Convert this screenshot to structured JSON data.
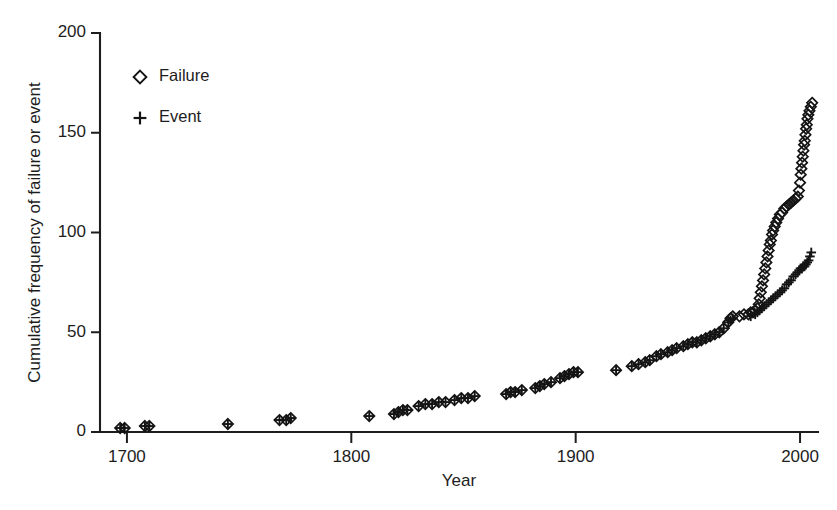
{
  "figure": {
    "background_color": "#ffffff",
    "ink_color": "#141414"
  },
  "chart_data": {
    "type": "scatter",
    "title": "",
    "xlabel": "Year",
    "ylabel": "Cumulative frequency of failure or event",
    "xlim": [
      1688,
      2008
    ],
    "ylim": [
      0,
      200
    ],
    "xticks": [
      1700,
      1800,
      1900,
      2000
    ],
    "xtick_labels": [
      "1700",
      "1800",
      "1900",
      "2000"
    ],
    "yticks": [
      0,
      50,
      100,
      150,
      200
    ],
    "ytick_labels": [
      "0",
      "50",
      "100",
      "150",
      "200"
    ],
    "grid": false,
    "legend_position": "upper-left-inside",
    "legend": [
      {
        "name": "Failure",
        "marker": "diamond"
      },
      {
        "name": "Event",
        "marker": "plus"
      }
    ],
    "series": [
      {
        "name": "Failure",
        "marker": "diamond",
        "color": "#141414",
        "points": [
          [
            1697,
            2
          ],
          [
            1699,
            2
          ],
          [
            1708,
            3
          ],
          [
            1710,
            3
          ],
          [
            1745,
            4
          ],
          [
            1768,
            6
          ],
          [
            1771,
            6
          ],
          [
            1773,
            7
          ],
          [
            1808,
            8
          ],
          [
            1819,
            9
          ],
          [
            1821,
            10
          ],
          [
            1823,
            11
          ],
          [
            1825,
            11
          ],
          [
            1830,
            13
          ],
          [
            1833,
            14
          ],
          [
            1836,
            14
          ],
          [
            1839,
            15
          ],
          [
            1842,
            15
          ],
          [
            1846,
            16
          ],
          [
            1849,
            17
          ],
          [
            1852,
            17
          ],
          [
            1855,
            18
          ],
          [
            1869,
            19
          ],
          [
            1871,
            20
          ],
          [
            1873,
            20
          ],
          [
            1876,
            21
          ],
          [
            1882,
            22
          ],
          [
            1884,
            23
          ],
          [
            1886,
            24
          ],
          [
            1889,
            25
          ],
          [
            1893,
            27
          ],
          [
            1895,
            28
          ],
          [
            1897,
            29
          ],
          [
            1899,
            30
          ],
          [
            1901,
            30
          ],
          [
            1918,
            31
          ],
          [
            1925,
            33
          ],
          [
            1928,
            34
          ],
          [
            1931,
            35
          ],
          [
            1933,
            36
          ],
          [
            1936,
            38
          ],
          [
            1938,
            39
          ],
          [
            1941,
            40
          ],
          [
            1943,
            41
          ],
          [
            1945,
            42
          ],
          [
            1948,
            43
          ],
          [
            1950,
            44
          ],
          [
            1952,
            45
          ],
          [
            1954,
            45
          ],
          [
            1956,
            46
          ],
          [
            1958,
            47
          ],
          [
            1960,
            48
          ],
          [
            1962,
            49
          ],
          [
            1964,
            50
          ],
          [
            1966,
            52
          ],
          [
            1968,
            55
          ],
          [
            1969,
            57
          ],
          [
            1970,
            58
          ],
          [
            1973,
            58
          ],
          [
            1975,
            59
          ],
          [
            1977,
            59
          ],
          [
            1978,
            60
          ],
          [
            1979,
            60
          ],
          [
            1980,
            61
          ],
          [
            1981,
            62
          ],
          [
            1981.6,
            64
          ],
          [
            1982,
            67
          ],
          [
            1982.5,
            70
          ],
          [
            1983,
            73
          ],
          [
            1983.5,
            76
          ],
          [
            1984,
            79
          ],
          [
            1984.5,
            82
          ],
          [
            1985,
            85
          ],
          [
            1985.5,
            88
          ],
          [
            1986,
            91
          ],
          [
            1986.5,
            94
          ],
          [
            1987,
            96
          ],
          [
            1987.5,
            99
          ],
          [
            1988,
            101
          ],
          [
            1988.7,
            103
          ],
          [
            1989.4,
            105
          ],
          [
            1990.2,
            107
          ],
          [
            1991,
            109
          ],
          [
            1992,
            110
          ],
          [
            1993,
            112
          ],
          [
            1994,
            113
          ],
          [
            1995,
            114
          ],
          [
            1996,
            115
          ],
          [
            1997,
            116
          ],
          [
            1998,
            117
          ],
          [
            1999,
            118
          ],
          [
            1999.5,
            121
          ],
          [
            2000,
            125
          ],
          [
            2000.3,
            129
          ],
          [
            2000.6,
            132
          ],
          [
            2000.9,
            135
          ],
          [
            2001.2,
            138
          ],
          [
            2001.5,
            141
          ],
          [
            2001.8,
            144
          ],
          [
            2002.1,
            146
          ],
          [
            2002.4,
            149
          ],
          [
            2002.7,
            152
          ],
          [
            2003,
            154
          ],
          [
            2003.3,
            157
          ],
          [
            2003.7,
            159
          ],
          [
            2004.2,
            161
          ],
          [
            2004.8,
            163
          ],
          [
            2005.4,
            165
          ]
        ]
      },
      {
        "name": "Event",
        "marker": "plus",
        "color": "#141414",
        "points": [
          [
            1697,
            2
          ],
          [
            1699,
            2
          ],
          [
            1708,
            3
          ],
          [
            1710,
            3
          ],
          [
            1745,
            4
          ],
          [
            1768,
            6
          ],
          [
            1771,
            6
          ],
          [
            1773,
            7
          ],
          [
            1808,
            8
          ],
          [
            1819,
            9
          ],
          [
            1821,
            10
          ],
          [
            1823,
            11
          ],
          [
            1825,
            11
          ],
          [
            1830,
            13
          ],
          [
            1833,
            14
          ],
          [
            1836,
            14
          ],
          [
            1839,
            15
          ],
          [
            1842,
            15
          ],
          [
            1846,
            16
          ],
          [
            1849,
            17
          ],
          [
            1852,
            17
          ],
          [
            1855,
            18
          ],
          [
            1869,
            19
          ],
          [
            1871,
            20
          ],
          [
            1873,
            20
          ],
          [
            1876,
            21
          ],
          [
            1882,
            22
          ],
          [
            1884,
            23
          ],
          [
            1886,
            24
          ],
          [
            1889,
            25
          ],
          [
            1893,
            27
          ],
          [
            1895,
            28
          ],
          [
            1897,
            29
          ],
          [
            1899,
            30
          ],
          [
            1901,
            30
          ],
          [
            1918,
            31
          ],
          [
            1925,
            33
          ],
          [
            1928,
            34
          ],
          [
            1931,
            35
          ],
          [
            1933,
            36
          ],
          [
            1936,
            38
          ],
          [
            1938,
            39
          ],
          [
            1941,
            40
          ],
          [
            1943,
            41
          ],
          [
            1945,
            42
          ],
          [
            1948,
            43
          ],
          [
            1950,
            44
          ],
          [
            1952,
            45
          ],
          [
            1954,
            45
          ],
          [
            1956,
            46
          ],
          [
            1958,
            47
          ],
          [
            1960,
            48
          ],
          [
            1962,
            49
          ],
          [
            1964,
            50
          ],
          [
            1966,
            52
          ],
          [
            1968,
            55
          ],
          [
            1969,
            56
          ],
          [
            1970,
            57
          ],
          [
            1978,
            58
          ],
          [
            1980,
            59
          ],
          [
            1981,
            60
          ],
          [
            1982,
            61
          ],
          [
            1983,
            62
          ],
          [
            1984,
            63
          ],
          [
            1985,
            64
          ],
          [
            1986,
            65
          ],
          [
            1987,
            66
          ],
          [
            1988,
            67
          ],
          [
            1989,
            68
          ],
          [
            1990,
            69
          ],
          [
            1991,
            70
          ],
          [
            1992,
            71
          ],
          [
            1993,
            72
          ],
          [
            1994,
            74
          ],
          [
            1995,
            75
          ],
          [
            1996,
            76
          ],
          [
            1997,
            78
          ],
          [
            1998,
            79
          ],
          [
            1999,
            80
          ],
          [
            1999.6,
            81
          ],
          [
            2000.2,
            82
          ],
          [
            2000.8,
            82
          ],
          [
            2001.4,
            83
          ],
          [
            2002,
            83
          ],
          [
            2002.6,
            84
          ],
          [
            2003.2,
            85
          ],
          [
            2003.8,
            86
          ],
          [
            2004.4,
            88
          ],
          [
            2005,
            90
          ]
        ]
      }
    ]
  },
  "axes_geometry": {
    "left": 100,
    "right": 818,
    "top": 33,
    "bottom": 432
  },
  "legend_geometry": {
    "marker_x": 140,
    "label_x": 159,
    "failure_y": 77,
    "event_y": 118
  }
}
